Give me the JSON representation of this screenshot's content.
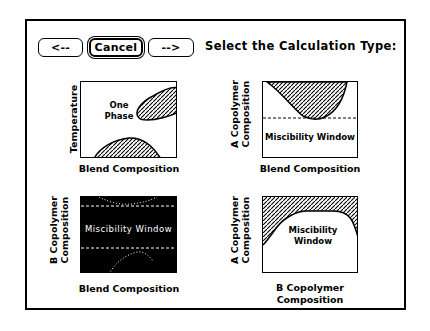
{
  "toolbar": {
    "back_label": "<--",
    "cancel_label": "Cancel",
    "forward_label": "-->"
  },
  "header": {
    "title": "Select the Calculation Type:"
  },
  "panels": [
    {
      "id": "temperature-blend",
      "selected": false,
      "y_label": "Temperature",
      "x_label": "Blend Composition",
      "region_label_line1": "One",
      "region_label_line2": "Phase"
    },
    {
      "id": "a-copolymer-blend",
      "selected": false,
      "y_label_line1": "A Copolymer",
      "y_label_line2": "Composition",
      "x_label": "Blend Composition",
      "region_label": "Miscibility Window"
    },
    {
      "id": "b-copolymer-blend",
      "selected": true,
      "y_label_line1": "B Copolymer",
      "y_label_line2": "Composition",
      "x_label": "Blend Composition",
      "region_label": "Miscibility Window"
    },
    {
      "id": "a-copolymer-b-copolymer",
      "selected": false,
      "y_label_line1": "A Copolymer",
      "y_label_line2": "Composition",
      "x_label_line1": "B Copolymer",
      "x_label_line2": "Composition",
      "region_label_line1": "Miscibility",
      "region_label_line2": "Window"
    }
  ],
  "colors": {
    "background": "#ffffff",
    "foreground": "#000000",
    "selected_fill": "#000000"
  }
}
